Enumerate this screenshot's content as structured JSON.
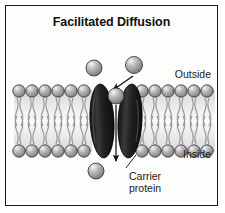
{
  "figure": {
    "title": "Facilitated Diffusion",
    "background_color": "#fdfdfc",
    "border_color": "#1a1a1a",
    "width": 225,
    "height": 213
  },
  "labels": {
    "outside": "Outside",
    "inside": "Inside",
    "carrier_line1": "Carrier",
    "carrier_line2": "protein"
  },
  "diagram": {
    "type": "cell-membrane-transport",
    "membrane": {
      "name": "phospholipid-bilayer",
      "top_head_row_y": 88,
      "bottom_head_row_y": 148,
      "head_radius": 6.2,
      "head_fill": "#9a9a9a",
      "head_highlight": "#e8e8e8",
      "head_stroke": "#2d2d2d",
      "tail_color": "#8c8c8c",
      "left_segment_x_start": 12,
      "left_segment_x_end": 92,
      "right_segment_x_start": 137,
      "right_segment_x_end": 213,
      "heads_per_side": 6
    },
    "carrier_protein": {
      "name": "carrier-protein",
      "fill": "#1d1d1d",
      "highlight": "#555555",
      "lobes": [
        {
          "cx": 101,
          "cy": 118,
          "rx": 12,
          "ry": 36,
          "rotate": -3
        },
        {
          "cx": 131,
          "cy": 118,
          "rx": 12,
          "ry": 36,
          "rotate": 3
        }
      ]
    },
    "molecules": [
      {
        "name": "molecule-outside-left",
        "cx": 96,
        "cy": 66,
        "r": 8.0
      },
      {
        "name": "molecule-outside-right",
        "cx": 135,
        "cy": 63,
        "r": 8.5
      },
      {
        "name": "molecule-in-channel",
        "cx": 116,
        "cy": 93,
        "r": 8.0
      },
      {
        "name": "molecule-inside-bottom",
        "cx": 98,
        "cy": 168,
        "r": 8.0
      }
    ],
    "molecule_style": {
      "fill": "#9d9d9d",
      "highlight": "#efefef",
      "stroke": "#2b2b2b"
    },
    "arrows": [
      {
        "name": "arrow-entry-diagonal",
        "x1": 132,
        "y1": 72,
        "x2": 111,
        "y2": 86
      },
      {
        "name": "arrow-transport-down",
        "x1": 116,
        "y1": 101,
        "x2": 116,
        "y2": 158
      }
    ],
    "leader_lines": [
      {
        "name": "leader-carrier-protein",
        "x1": 137,
        "y1": 152,
        "x2": 128,
        "y2": 165
      }
    ]
  }
}
